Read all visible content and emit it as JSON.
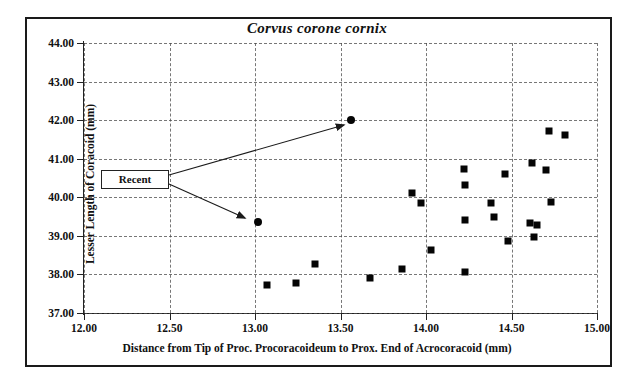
{
  "chart_data": {
    "type": "scatter",
    "title": "Corvus corone cornix",
    "xlabel": "Distance from Tip of Proc. Procoracoideum to Prox. End of Acrocoracoid (mm)",
    "ylabel": "Lesser Length of Coracoid (mm)",
    "xlim": [
      12.0,
      15.0
    ],
    "ylim": [
      37.0,
      44.0
    ],
    "xticks": [
      "12.00",
      "12.50",
      "13.00",
      "13.50",
      "14.00",
      "14.50",
      "15.00"
    ],
    "yticks": [
      "37.00",
      "38.00",
      "39.00",
      "40.00",
      "41.00",
      "42.00",
      "43.00",
      "44.00"
    ],
    "xtick_values": [
      12.0,
      12.5,
      13.0,
      13.5,
      14.0,
      14.5,
      15.0
    ],
    "ytick_values": [
      37.0,
      38.0,
      39.0,
      40.0,
      41.0,
      42.0,
      43.0,
      44.0
    ],
    "grid": true,
    "grid_style": "dashed",
    "legend": "none",
    "series": [
      {
        "name": "Fossil",
        "marker": "square",
        "color": "#050505",
        "points": [
          {
            "x": 13.07,
            "y": 37.73
          },
          {
            "x": 13.24,
            "y": 37.79
          },
          {
            "x": 13.35,
            "y": 38.26
          },
          {
            "x": 13.67,
            "y": 37.92
          },
          {
            "x": 13.86,
            "y": 38.15
          },
          {
            "x": 13.92,
            "y": 40.11
          },
          {
            "x": 13.97,
            "y": 39.85
          },
          {
            "x": 14.03,
            "y": 38.64
          },
          {
            "x": 14.22,
            "y": 40.73
          },
          {
            "x": 14.23,
            "y": 40.31
          },
          {
            "x": 14.23,
            "y": 39.4
          },
          {
            "x": 14.23,
            "y": 38.07
          },
          {
            "x": 14.38,
            "y": 39.84
          },
          {
            "x": 14.4,
            "y": 39.49
          },
          {
            "x": 14.46,
            "y": 40.61
          },
          {
            "x": 14.48,
            "y": 38.87
          },
          {
            "x": 14.61,
            "y": 39.34
          },
          {
            "x": 14.62,
            "y": 40.89
          },
          {
            "x": 14.63,
            "y": 38.96
          },
          {
            "x": 14.65,
            "y": 39.28
          },
          {
            "x": 14.7,
            "y": 40.72
          },
          {
            "x": 14.72,
            "y": 41.71
          },
          {
            "x": 14.73,
            "y": 39.87
          },
          {
            "x": 14.81,
            "y": 41.62
          }
        ]
      },
      {
        "name": "Recent",
        "marker": "circle",
        "color": "#050505",
        "points": [
          {
            "x": 13.56,
            "y": 42.0
          },
          {
            "x": 13.02,
            "y": 39.35
          }
        ]
      }
    ],
    "annotations": [
      {
        "label": "Recent",
        "box": {
          "x": 101,
          "y": 170,
          "w": 68,
          "h": 19
        },
        "arrows": [
          {
            "from_x": 169,
            "from_y": 175,
            "to_x": 344,
            "to_y": 125
          },
          {
            "from_x": 169,
            "from_y": 184,
            "to_x": 245,
            "to_y": 218
          }
        ]
      }
    ]
  },
  "figure": {
    "border_color": "#1a1a1a",
    "background": "#ffffff",
    "axis_color": "#222222",
    "grid_color": "#4a4a4a"
  }
}
